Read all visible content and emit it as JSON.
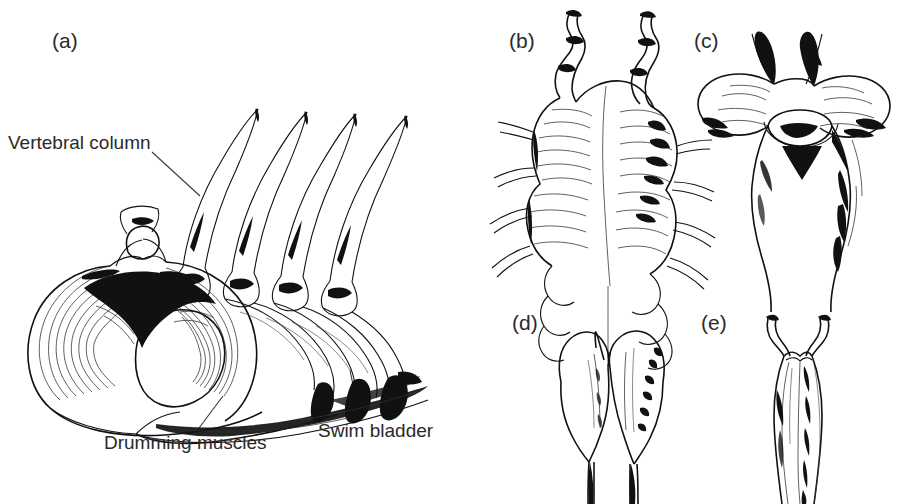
{
  "figure": {
    "kind": "scientific-line-drawing",
    "background_color": "#ffffff",
    "ink_color": "#111111",
    "text_color": "#2a2a2a"
  },
  "panels": [
    {
      "id": "a",
      "letter": "(a)",
      "description": "Cutaway view of vertebral column with neural spines, drumming muscles surrounding the swim bladder",
      "labels": [
        {
          "id": "vertebral-column",
          "text": "Vertebral column"
        },
        {
          "id": "drumming-muscles",
          "text": "Drumming muscles"
        },
        {
          "id": "swim-bladder",
          "text": "Swim bladder"
        }
      ]
    },
    {
      "id": "b",
      "letter": "(b)",
      "description": "Swim bladder with paired anterior horns and lateral diverticula"
    },
    {
      "id": "c",
      "letter": "(c)",
      "description": "Swim bladder with broad transverse anterior lobes and dark paired processes"
    },
    {
      "id": "d",
      "letter": "(d)",
      "description": "Bilobed heart-shaped anterior swim bladder"
    },
    {
      "id": "e",
      "letter": "(e)",
      "description": "Elongate swim bladder with two slender anterior horns"
    }
  ],
  "labels": {
    "vertebral_column": "Vertebral column",
    "drumming_muscles": "Drumming muscles",
    "swim_bladder": "Swim bladder",
    "letter_a": "(a)",
    "letter_b": "(b)",
    "letter_c": "(c)",
    "letter_d": "(d)",
    "letter_e": "(e)"
  }
}
